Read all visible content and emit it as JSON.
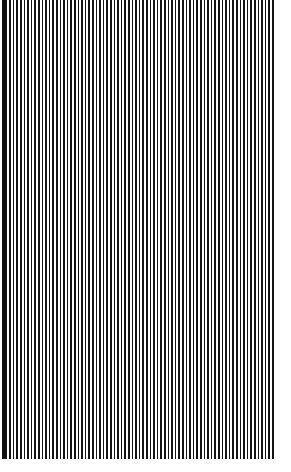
{
  "image": {
    "kind": "vertical-stripe-pattern",
    "description": "Full-bleed pattern of thin black vertical stripes on a white background",
    "width_px": 291,
    "height_px": 472
  },
  "pattern": {
    "orientation": "vertical",
    "stripe_color": "#141414",
    "background_color": "#ffffff",
    "period_px": 3.6,
    "stripe_width_px": 1.7,
    "gap_width_px": 1.9,
    "duty_cycle_percent": 47,
    "stripe_count": 76
  },
  "field": {
    "left_px": 2,
    "top_px": 0,
    "width_px": 272,
    "height_px": 459
  },
  "margins": {
    "left_px": 2,
    "top_px": 0,
    "right_px": 17,
    "bottom_px": 13,
    "color": "#ffffff"
  },
  "left_edge_bar": {
    "color": "#111111",
    "left_px": 2,
    "width_px": 4,
    "height_px": 459
  }
}
